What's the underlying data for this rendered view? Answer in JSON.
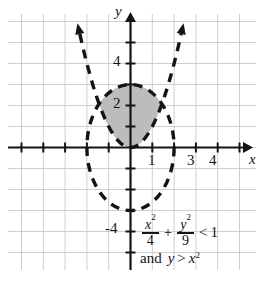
{
  "figure": {
    "kind": "coordinate-plane-inequality-graph",
    "width": 266,
    "height": 282,
    "background": "#ffffff"
  },
  "colors": {
    "grid": "#c8c8cc",
    "axis": "#141414",
    "curve": "#141414",
    "shade_fill": "#bcbcbc",
    "text": "#141414"
  },
  "axes": {
    "x_label": "x",
    "y_label": "y",
    "x_ticks": [
      {
        "value": 1,
        "label": "1",
        "show_label": true
      },
      {
        "value": 3,
        "label": "3",
        "show_label": true
      },
      {
        "value": 4,
        "label": "4",
        "show_label": true
      }
    ],
    "y_ticks": [
      {
        "value": 4,
        "label": "4",
        "show_label": true
      },
      {
        "value": 2,
        "label": "2",
        "show_label": true
      },
      {
        "value": -4,
        "label": "-4",
        "show_label": true
      }
    ],
    "xlim": [
      -5.5,
      5.5
    ],
    "ylim": [
      -5.5,
      6.0
    ],
    "grid": true
  },
  "equation": {
    "line1": {
      "frac1_num": "x",
      "frac1_num_exp": "2",
      "frac1_den": "4",
      "plus": "+",
      "frac2_num": "y",
      "frac2_num_exp": "2",
      "frac2_den": "9",
      "relation": "<",
      "rhs": "1"
    },
    "line2": {
      "and": "and",
      "lhs": "y",
      "relation": ">",
      "rhs": "x",
      "rhs_exp": "2"
    },
    "text_plain_line1": "x^2/4 + y^2/9 < 1",
    "text_plain_line2": "and y > x^2"
  },
  "chart_data": {
    "type": "scatter",
    "title": "",
    "xlabel": "x",
    "ylabel": "y",
    "xlim": [
      -5.5,
      5.5
    ],
    "ylim": [
      -5.5,
      6.0
    ],
    "grid": true,
    "curves": [
      {
        "name": "ellipse",
        "equation": "x^2/4 + y^2/9 = 1",
        "style": "dashed",
        "semi_axis_x": 2,
        "semi_axis_y": 3,
        "center": [
          0,
          0
        ],
        "boundary_included": false
      },
      {
        "name": "parabola",
        "equation": "y = x^2",
        "style": "dashed",
        "vertex": [
          0,
          0
        ],
        "arrows": [
          "upper-left",
          "upper-right"
        ],
        "boundary_included": false
      }
    ],
    "shaded_region": {
      "description": "interior of ellipse above parabola",
      "fill": "#bcbcbc",
      "inequalities": [
        "x^2/4 + y^2/9 < 1",
        "y > x^2"
      ]
    }
  }
}
